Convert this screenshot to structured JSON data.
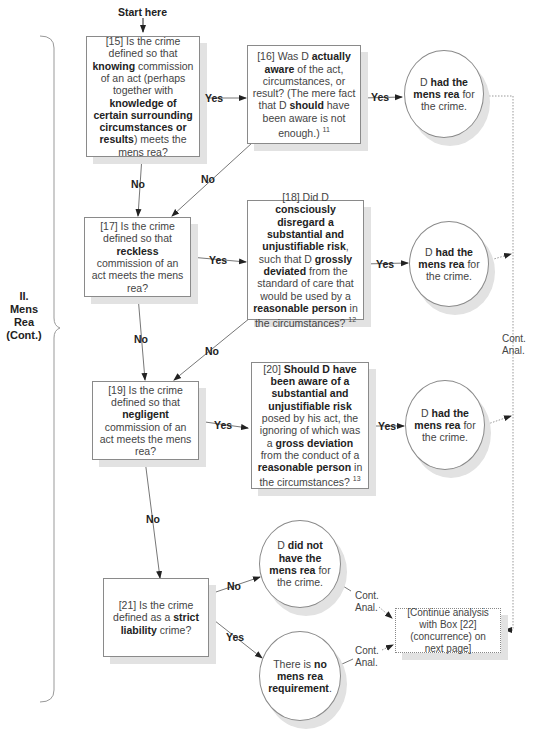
{
  "start_label": "Start here",
  "section_label": {
    "line1": "II.",
    "line2": "Mens",
    "line3": "Rea",
    "line4": "(Cont.)"
  },
  "boxes": {
    "b15": {
      "pre": "[15] Is the crime defined so that ",
      "b1": "knowing",
      "mid": " commission of an act (perhaps together with ",
      "b2": "knowledge of certain surrounding circumstances or results",
      "post": ") meets the mens rea?"
    },
    "b16": {
      "pre": "[16] Was D ",
      "b1": "actually aware",
      "mid": " of the act, circumstances, or result? (The mere fact that D ",
      "b2": "should",
      "post": " have been aware is not enough.) ",
      "sup": "11"
    },
    "b17": {
      "pre": "[17] Is the crime defined so that ",
      "b1": "reckless",
      "post": " commission of an act meets the mens rea?"
    },
    "b18": {
      "pre": "[18] Did D ",
      "b1": "consciously disregard a substantial and unjustifiable risk",
      "mid": ", such that D ",
      "b2": "grossly deviated",
      "mid2": " from the standard of care that would be used by a ",
      "b3": "reasonable person",
      "post": " in the circumstances? ",
      "sup": "12"
    },
    "b19": {
      "pre": "[19] Is the crime defined so that ",
      "b1": "negligent",
      "post": " commission of an act meets the mens rea?"
    },
    "b20": {
      "pre": "[20] ",
      "b1": "Should D have been aware of a substantial and unjustifiable risk",
      "mid": " posed by his act, the ignoring of which was a ",
      "b2": "gross deviation",
      "mid2": " from the conduct of a ",
      "b3": "reasonable person",
      "post": " in the circumstances? ",
      "sup": "13"
    },
    "b21": {
      "pre": "[21] Is the crime defined as a ",
      "b1": "strict liability",
      "post": " crime?"
    },
    "continue": {
      "text": "[Continue analysis with Box [22] (concurrence) on next page]"
    }
  },
  "circles": {
    "c1": {
      "pre": "D ",
      "b1": "had the mens rea",
      "post": " for the crime."
    },
    "c2": {
      "pre": "D ",
      "b1": "had the mens rea",
      "post": " for the crime."
    },
    "c3": {
      "pre": "D ",
      "b1": "had the mens rea",
      "post": " for the crime."
    },
    "c4": {
      "pre": "D ",
      "b1": "did not have the mens rea",
      "post": " for the crime."
    },
    "c5": {
      "pre": "There is ",
      "b1": "no mens rea requirement",
      "post": "."
    }
  },
  "edge_labels": {
    "yes": "Yes",
    "no": "No",
    "cont_line1": "Cont.",
    "cont_line2": "Anal."
  }
}
